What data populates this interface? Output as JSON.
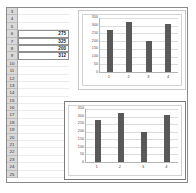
{
  "spreadsheet": {
    "first_row": 3,
    "last_row": 25,
    "rows": [
      {
        "header": "3",
        "value": ""
      },
      {
        "header": "4",
        "value": ""
      },
      {
        "header": "5",
        "value": ""
      },
      {
        "header": "6",
        "value": "275"
      },
      {
        "header": "7",
        "value": "325"
      },
      {
        "header": "8",
        "value": "200"
      },
      {
        "header": "9",
        "value": "312"
      },
      {
        "header": "10",
        "value": ""
      },
      {
        "header": "11",
        "value": ""
      },
      {
        "header": "12",
        "value": ""
      },
      {
        "header": "13",
        "value": ""
      },
      {
        "header": "14",
        "value": ""
      },
      {
        "header": "15",
        "value": ""
      },
      {
        "header": "16",
        "value": ""
      },
      {
        "header": "17",
        "value": ""
      },
      {
        "header": "18",
        "value": ""
      },
      {
        "header": "19",
        "value": ""
      },
      {
        "header": "20",
        "value": ""
      },
      {
        "header": "21",
        "value": ""
      },
      {
        "header": "22",
        "value": ""
      },
      {
        "header": "23",
        "value": ""
      },
      {
        "header": "24",
        "value": ""
      },
      {
        "header": "25",
        "value": ""
      }
    ]
  },
  "colors": {
    "bar": "#595959",
    "gridline": "#dcdcdc",
    "axis": "#b4b4b4",
    "row_header_bg": "#d9d9d9",
    "frame": "#8a8a8a"
  },
  "chart_data": [
    {
      "type": "bar",
      "name": "top-chart",
      "title": "",
      "xlabel": "",
      "ylabel": "",
      "categories": [
        "1",
        "2",
        "3",
        "4"
      ],
      "values": [
        275,
        325,
        200,
        312
      ],
      "yticks": [
        0,
        50,
        100,
        150,
        200,
        250,
        300,
        350
      ],
      "ylim": [
        0,
        350
      ],
      "grid": true,
      "legend": false
    },
    {
      "type": "bar",
      "name": "bottom-chart",
      "title": "",
      "xlabel": "",
      "ylabel": "",
      "categories": [
        "1",
        "2",
        "3",
        "4"
      ],
      "values": [
        275,
        325,
        200,
        312
      ],
      "yticks": [
        0,
        50,
        100,
        150,
        200,
        250,
        300,
        350
      ],
      "ylim": [
        0,
        350
      ],
      "grid": true,
      "legend": false
    }
  ]
}
